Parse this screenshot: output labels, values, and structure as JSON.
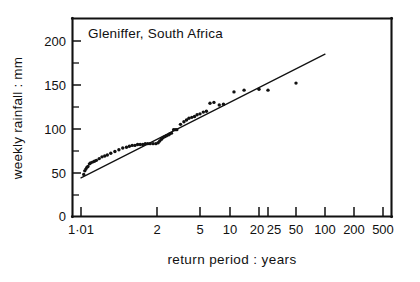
{
  "figure": {
    "title": "Gleniffer, South Africa",
    "background_color": "#ffffff",
    "ink_color": "#111111"
  },
  "chart_data": {
    "type": "scatter",
    "title": "Gleniffer, South Africa",
    "xlabel": "return period : years",
    "ylabel": "weekly rainfall : mm",
    "x_scale": "gumbel-log",
    "xlim": [
      1.01,
      700
    ],
    "ylim": [
      0,
      225
    ],
    "grid": false,
    "legend": "none",
    "x_tick_labels": [
      "1·01",
      "2",
      "5",
      "10",
      "20",
      "25",
      "50",
      "100",
      "200",
      "500"
    ],
    "x_tick_values": [
      1.01,
      2,
      5,
      10,
      20,
      25,
      50,
      100,
      200,
      500
    ],
    "y_tick_labels": [
      "0",
      "50",
      "100",
      "150",
      "200"
    ],
    "y_tick_values": [
      0,
      50,
      100,
      150,
      200
    ],
    "y_minor_tick_values": [
      25,
      75,
      125,
      175
    ],
    "series": [
      {
        "name": "annual maximum weekly rainfall",
        "marker": "filled-circle",
        "points": [
          [
            1.035,
            48
          ],
          [
            1.045,
            52
          ],
          [
            1.055,
            54
          ],
          [
            1.065,
            56
          ],
          [
            1.075,
            57
          ],
          [
            1.09,
            60
          ],
          [
            1.1,
            61
          ],
          [
            1.12,
            62
          ],
          [
            1.14,
            63
          ],
          [
            1.16,
            64
          ],
          [
            1.19,
            66
          ],
          [
            1.22,
            68
          ],
          [
            1.25,
            69
          ],
          [
            1.28,
            70
          ],
          [
            1.32,
            72
          ],
          [
            1.37,
            74
          ],
          [
            1.42,
            76
          ],
          [
            1.47,
            78
          ],
          [
            1.52,
            79
          ],
          [
            1.56,
            80
          ],
          [
            1.6,
            81
          ],
          [
            1.64,
            81
          ],
          [
            1.68,
            82
          ],
          [
            1.72,
            82
          ],
          [
            1.76,
            82
          ],
          [
            1.8,
            83
          ],
          [
            1.84,
            83
          ],
          [
            1.88,
            83
          ],
          [
            1.93,
            83
          ],
          [
            1.98,
            83
          ],
          [
            2.05,
            84
          ],
          [
            2.12,
            86
          ],
          [
            2.2,
            88
          ],
          [
            2.28,
            90
          ],
          [
            2.36,
            91
          ],
          [
            2.45,
            92
          ],
          [
            2.55,
            93
          ],
          [
            2.62,
            94
          ],
          [
            2.72,
            95
          ],
          [
            2.85,
            99
          ],
          [
            2.95,
            99
          ],
          [
            3.05,
            99
          ],
          [
            3.3,
            105
          ],
          [
            3.55,
            108
          ],
          [
            3.75,
            110
          ],
          [
            3.95,
            112
          ],
          [
            4.2,
            113
          ],
          [
            4.45,
            114
          ],
          [
            4.7,
            116
          ],
          [
            5.0,
            117
          ],
          [
            5.4,
            119
          ],
          [
            5.8,
            120
          ],
          [
            6.3,
            129
          ],
          [
            6.9,
            130
          ],
          [
            7.8,
            127
          ],
          [
            8.6,
            128
          ],
          [
            11.0,
            142
          ],
          [
            14.0,
            144
          ],
          [
            20.0,
            145
          ],
          [
            25.0,
            144
          ],
          [
            50.0,
            152
          ]
        ]
      }
    ],
    "fit_line": {
      "name": "fitted straight line",
      "points": [
        [
          1.01,
          44
        ],
        [
          100.0,
          185
        ]
      ]
    }
  },
  "axes": {
    "x_label": "return period : years",
    "y_label": "weekly rainfall : mm"
  }
}
